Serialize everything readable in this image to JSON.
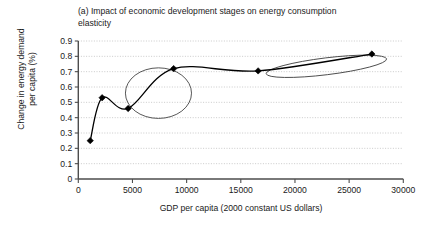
{
  "chart_data": {
    "type": "line",
    "title": "(a) Impact of economic development stages on energy consumption\nelasticity",
    "xlabel": "GDP per capita (2000 constant US dollars)",
    "ylabel": "Change in energy demand\nper capita (%)",
    "xlim": [
      0,
      30000
    ],
    "ylim": [
      0,
      0.9
    ],
    "grid": true,
    "legend": null,
    "x_ticks": [
      "0",
      "5000",
      "10000",
      "15000",
      "20000",
      "25000",
      "30000"
    ],
    "x_tick_values": [
      0,
      5000,
      10000,
      15000,
      20000,
      25000,
      30000
    ],
    "y_ticks": [
      "0",
      "0.1",
      "0.2",
      "0.3",
      "0.4",
      "0.5",
      "0.6",
      "0.7",
      "0.8",
      "0.9"
    ],
    "y_tick_values": [
      0,
      0.1,
      0.2,
      0.3,
      0.4,
      0.5,
      0.6,
      0.7,
      0.8,
      0.9
    ],
    "series": [
      {
        "name": "Change in energy demand per capita",
        "marker": "diamond",
        "color": "#000000",
        "x": [
          1100,
          2200,
          4600,
          8800,
          16600,
          27100
        ],
        "values": [
          0.25,
          0.53,
          0.46,
          0.72,
          0.705,
          0.815
        ]
      }
    ],
    "annotations": [
      {
        "name": "take-off-stage-circle",
        "shape": "ellipse",
        "cx": 7400,
        "cy": 0.56,
        "rx": 3050,
        "ry": 0.165,
        "rotation": 0,
        "color": "#444444"
      },
      {
        "name": "mature-stage-ellipse",
        "shape": "ellipse",
        "cx": 22900,
        "cy": 0.735,
        "rx": 5600,
        "ry": 0.055,
        "rotation": -7,
        "color": "#444444"
      }
    ]
  },
  "axes": {
    "x_title": "GDP per capita (2000 constant US dollars)",
    "y_title": "Change in energy demand\nper capita (%)"
  }
}
